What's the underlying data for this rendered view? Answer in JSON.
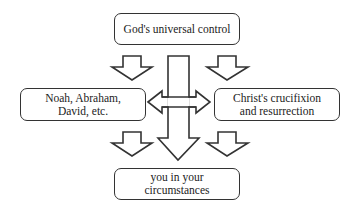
{
  "diagram": {
    "nodes": {
      "top": {
        "label": "God's universal control"
      },
      "left": {
        "label_line1": "Noah, Abraham,",
        "label_line2": "David, etc."
      },
      "right": {
        "label_line1": "Christ's crucifixion",
        "label_line2": "and resurrection"
      },
      "bottom": {
        "label_line1": "you in your",
        "label_line2": "circumstances"
      }
    },
    "edges": [
      {
        "from": "top",
        "to": "left",
        "type": "block-arrow-down"
      },
      {
        "from": "top",
        "to": "right",
        "type": "block-arrow-down"
      },
      {
        "from": "top",
        "to": "bottom",
        "type": "long-block-arrow-down"
      },
      {
        "from": "left",
        "to": "right",
        "type": "double-headed-block-arrow"
      },
      {
        "from": "left",
        "to": "bottom",
        "type": "block-arrow-down"
      },
      {
        "from": "right",
        "to": "bottom",
        "type": "block-arrow-down"
      }
    ],
    "colors": {
      "stroke": "#333333",
      "fill": "#ffffff"
    }
  }
}
